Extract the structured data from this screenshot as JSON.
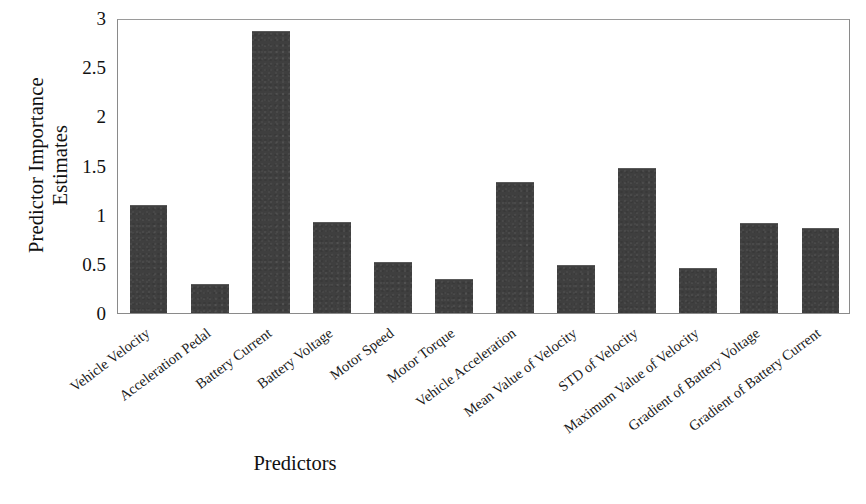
{
  "chart_data": {
    "type": "bar",
    "title": "",
    "subtitle": "",
    "xlabel": "Predictors",
    "ylabel_line1": "Predictor Importance",
    "ylabel_line2": "Estimates",
    "ylabel": "Predictor Importance Estimates",
    "categories": [
      "Vehicle Velocity",
      "Acceleration Pedal",
      "Battery Current",
      "Battery Voltage",
      "Motor Speed",
      "Motor Torque",
      "Vehicle Acceleration",
      "Mean Value of Velocity",
      "STD of Velocity",
      "Maximum Value of Velocity",
      "Gradient of Battery Voltage",
      "Gradient of Battery Current"
    ],
    "values": [
      1.1,
      0.29,
      2.87,
      0.93,
      0.52,
      0.35,
      1.33,
      0.49,
      1.47,
      0.46,
      0.92,
      0.86
    ],
    "ylim": [
      0,
      3
    ],
    "yticks": [
      0,
      0.5,
      1,
      1.5,
      2,
      2.5,
      3
    ],
    "ytick_labels": [
      "0",
      "0.5",
      "1",
      "1.5",
      "2",
      "2.5",
      "3"
    ],
    "grid": false,
    "legend": null,
    "bar_color": "#3f3f3f",
    "axis_color": "#8a8a8a",
    "text_color": "#111111",
    "label_rotation_deg": -37
  }
}
